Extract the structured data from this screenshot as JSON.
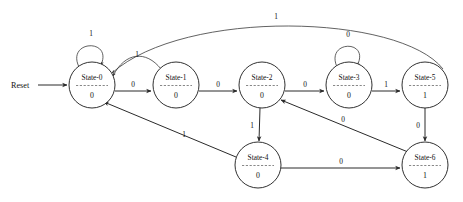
{
  "diagram": {
    "reset_label": "Reset",
    "colors": {
      "background": "#ffffff",
      "stroke": "#1a1a1a",
      "edge": "#2a2a2a",
      "text": "#111111"
    },
    "states": [
      {
        "id": "state-0",
        "name": "State-0",
        "output": "0",
        "cx": 92,
        "cy": 85,
        "r": 23
      },
      {
        "id": "state-1",
        "name": "State-1",
        "output": "0",
        "cx": 176,
        "cy": 85,
        "r": 23
      },
      {
        "id": "state-2",
        "name": "State-2",
        "output": "0",
        "cx": 262,
        "cy": 85,
        "r": 23
      },
      {
        "id": "state-3",
        "name": "State-3",
        "output": "0",
        "cx": 349,
        "cy": 85,
        "r": 23
      },
      {
        "id": "state-4",
        "name": "State-4",
        "output": "0",
        "cx": 258,
        "cy": 165,
        "r": 23
      },
      {
        "id": "state-5",
        "name": "State-5",
        "output": "1",
        "cx": 425,
        "cy": 85,
        "r": 23
      },
      {
        "id": "state-6",
        "name": "State-6",
        "output": "1",
        "cx": 425,
        "cy": 165,
        "r": 23
      }
    ],
    "transitions": [
      {
        "id": "t-reset",
        "from": "reset",
        "to": "state-0",
        "label": ""
      },
      {
        "id": "t-0-0",
        "from": "state-0",
        "to": "state-0",
        "label": "1",
        "kind": "self-loop"
      },
      {
        "id": "t-0-1",
        "from": "state-0",
        "to": "state-1",
        "label": "0",
        "kind": "straight"
      },
      {
        "id": "t-1-0",
        "from": "state-1",
        "to": "state-0",
        "label": "1",
        "kind": "arc"
      },
      {
        "id": "t-1-2",
        "from": "state-1",
        "to": "state-2",
        "label": "0",
        "kind": "straight"
      },
      {
        "id": "t-2-3",
        "from": "state-2",
        "to": "state-3",
        "label": "0",
        "kind": "straight"
      },
      {
        "id": "t-2-4",
        "from": "state-2",
        "to": "state-4",
        "label": "1",
        "kind": "straight"
      },
      {
        "id": "t-3-3",
        "from": "state-3",
        "to": "state-3",
        "label": "0",
        "kind": "self-loop"
      },
      {
        "id": "t-3-5",
        "from": "state-3",
        "to": "state-5",
        "label": "1",
        "kind": "straight"
      },
      {
        "id": "t-4-0",
        "from": "state-4",
        "to": "state-0",
        "label": "1",
        "kind": "straight"
      },
      {
        "id": "t-4-6",
        "from": "state-4",
        "to": "state-6",
        "label": "0",
        "kind": "straight"
      },
      {
        "id": "t-5-0",
        "from": "state-5",
        "to": "state-0",
        "label": "1",
        "kind": "long-arc"
      },
      {
        "id": "t-5-6",
        "from": "state-5",
        "to": "state-6",
        "label": "0",
        "kind": "straight"
      },
      {
        "id": "t-6-2",
        "from": "state-6",
        "to": "state-2",
        "label": "0",
        "kind": "straight"
      }
    ],
    "labels": {
      "self_loop_0": "1",
      "self_loop_3": "0",
      "edge_0_1": "0",
      "edge_1_0": "1",
      "edge_1_2": "0",
      "edge_2_3": "0",
      "edge_2_4": "1",
      "edge_3_5": "1",
      "edge_4_0": "1",
      "edge_4_6": "0",
      "edge_5_0": "1",
      "edge_5_6": "0",
      "edge_6_2": "0"
    }
  }
}
